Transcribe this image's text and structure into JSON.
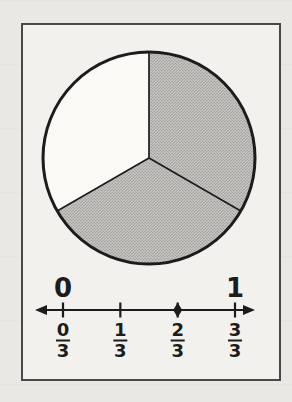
{
  "figure": {
    "page_background": "#e9e8e4",
    "frame_background": "#f2f1ed",
    "frame_border_color": "#4a4947",
    "ink_color": "#1c1c1c",
    "shaded_fill_base": "#c9c8c5",
    "shaded_fill_dot": "#a09e9a",
    "unshaded_fill": "#faf9f6"
  },
  "chart_data": [
    {
      "type": "pie",
      "title": "",
      "num_equal_parts": 3,
      "shaded_parts": 2,
      "fraction_shaded": "2/3",
      "slices": [
        {
          "name": "shaded",
          "parts": 2,
          "start_angle_deg": 0,
          "end_angle_deg": 240,
          "fill": "halftone-gray"
        },
        {
          "name": "unshaded",
          "parts": 1,
          "start_angle_deg": 240,
          "end_angle_deg": 360,
          "fill": "white"
        }
      ],
      "divider_angles_deg": [
        0,
        120,
        240
      ],
      "legend_position": "none"
    },
    {
      "type": "line",
      "title": "",
      "axis": {
        "min": 0,
        "max": 1,
        "min_label": "0",
        "max_label": "1",
        "arrows": "both-ends",
        "grid": false
      },
      "ticks": [
        {
          "numerator": "0",
          "denominator": "3",
          "value": 0,
          "marked_point": false
        },
        {
          "numerator": "1",
          "denominator": "3",
          "value": 0.3333,
          "marked_point": false
        },
        {
          "numerator": "2",
          "denominator": "3",
          "value": 0.6667,
          "marked_point": true
        },
        {
          "numerator": "3",
          "denominator": "3",
          "value": 1,
          "marked_point": false
        }
      ],
      "marked_point_value": "2/3"
    }
  ]
}
